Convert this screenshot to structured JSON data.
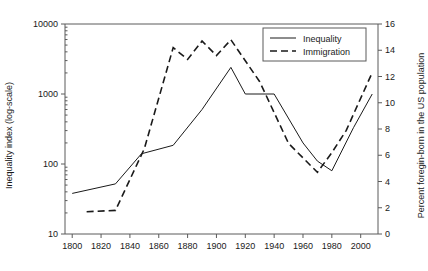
{
  "chart_data": {
    "type": "line",
    "title": "",
    "xlabel": "",
    "ylabel": "Inequality index (log-scale)",
    "ylabel_right": "Percent foregin-born in the US population",
    "xlim": [
      1795,
      2012
    ],
    "ylim_left": [
      10,
      10000
    ],
    "ylim_right": [
      0,
      16
    ],
    "yscale_left": "log",
    "yscale_right": "linear",
    "grid": false,
    "legend_position": "top-right",
    "xticks": [
      1800,
      1820,
      1840,
      1860,
      1880,
      1900,
      1920,
      1940,
      1960,
      1980,
      2000
    ],
    "yticks_left": [
      10,
      100,
      1000,
      10000
    ],
    "yticks_right": [
      0,
      2,
      4,
      6,
      8,
      10,
      12,
      14,
      16
    ],
    "series": [
      {
        "name": "Inequality",
        "style": "solid",
        "axis": "left",
        "x": [
          1800,
          1830,
          1848,
          1870,
          1890,
          1910,
          1920,
          1940,
          1960,
          1970,
          1980,
          1995,
          2008
        ],
        "values": [
          38,
          52,
          140,
          185,
          600,
          2400,
          1000,
          1000,
          200,
          110,
          80,
          330,
          1000
        ]
      },
      {
        "name": "Immigration",
        "style": "dashed",
        "axis": "right",
        "x": [
          1810,
          1830,
          1850,
          1870,
          1880,
          1890,
          1900,
          1910,
          1920,
          1930,
          1950,
          1970,
          1980,
          1990,
          2008
        ],
        "values": [
          1.7,
          1.8,
          6.5,
          14.2,
          13.3,
          14.7,
          13.6,
          14.8,
          13.2,
          11.6,
          6.9,
          4.7,
          6.2,
          7.9,
          12.3
        ]
      }
    ]
  },
  "legend": {
    "entries": [
      {
        "label": "Inequality",
        "style": "solid"
      },
      {
        "label": "Immigration",
        "style": "dashed"
      }
    ]
  },
  "axes": {
    "left_title": "Inequality index (log-scale)",
    "right_title": "Percent foregin-born in the US population"
  }
}
